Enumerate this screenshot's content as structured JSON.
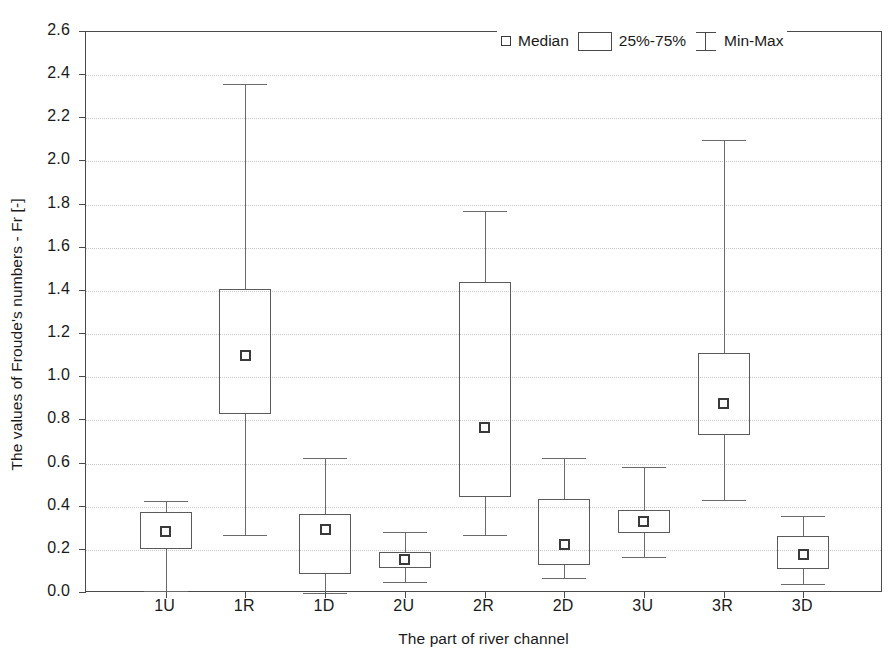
{
  "chart_data": {
    "type": "box",
    "title": "",
    "xlabel": "The part of river channel",
    "ylabel": "The values of Froude's numbers - Fr [-]",
    "categories": [
      "1U",
      "1R",
      "1D",
      "2U",
      "2R",
      "2D",
      "3U",
      "3R",
      "3D"
    ],
    "ylim": [
      0.0,
      2.6
    ],
    "yticks": [
      "0.0",
      "0.2",
      "0.4",
      "0.6",
      "0.8",
      "1.0",
      "1.2",
      "1.4",
      "1.6",
      "1.8",
      "2.0",
      "2.2",
      "2.4",
      "2.6"
    ],
    "ytick_values": [
      0.0,
      0.2,
      0.4,
      0.6,
      0.8,
      1.0,
      1.2,
      1.4,
      1.6,
      1.8,
      2.0,
      2.2,
      2.4,
      2.6
    ],
    "grid": true,
    "grid_axis": "y",
    "legend_position": "top-right",
    "legend": [
      {
        "key": "median",
        "label": "Median",
        "marker": "open-square"
      },
      {
        "key": "iqr",
        "label": "25%-75%",
        "marker": "rectangle"
      },
      {
        "key": "minmax",
        "label": "Min-Max",
        "marker": "i-beam"
      }
    ],
    "boxes": [
      {
        "category": "1U",
        "min": 0.01,
        "q1": 0.205,
        "median": 0.285,
        "q3": 0.375,
        "max": 0.425
      },
      {
        "category": "1R",
        "min": 0.27,
        "q1": 0.83,
        "median": 1.1,
        "q3": 1.41,
        "max": 2.36
      },
      {
        "category": "1D",
        "min": 0.0,
        "q1": 0.09,
        "median": 0.295,
        "q3": 0.365,
        "max": 0.625
      },
      {
        "category": "2U",
        "min": 0.05,
        "q1": 0.115,
        "median": 0.155,
        "q3": 0.19,
        "max": 0.285
      },
      {
        "category": "2R",
        "min": 0.27,
        "q1": 0.445,
        "median": 0.765,
        "q3": 1.44,
        "max": 1.77
      },
      {
        "category": "2D",
        "min": 0.07,
        "q1": 0.13,
        "median": 0.225,
        "q3": 0.435,
        "max": 0.625
      },
      {
        "category": "3U",
        "min": 0.165,
        "q1": 0.28,
        "median": 0.33,
        "q3": 0.385,
        "max": 0.585
      },
      {
        "category": "3R",
        "min": 0.43,
        "q1": 0.73,
        "median": 0.88,
        "q3": 1.11,
        "max": 2.1
      },
      {
        "category": "3D",
        "min": 0.04,
        "q1": 0.11,
        "median": 0.18,
        "q3": 0.265,
        "max": 0.355
      }
    ],
    "colors": {
      "box_stroke": "#5a5a5a",
      "whisker_stroke": "#6a6a6a",
      "median_stroke": "#3a3a3a",
      "axis": "#4a4a4a",
      "grid": "#c8c8c8",
      "background": "#ffffff",
      "text": "#1a1a1a"
    }
  }
}
